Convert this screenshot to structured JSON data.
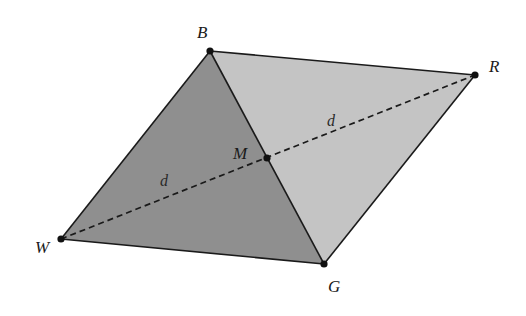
{
  "figure": {
    "type": "parallelogram-diagonal-bisection",
    "colors": {
      "background": "#ffffff",
      "left_triangle_fill": "#8f8f8f",
      "right_triangle_fill": "#c4c4c4",
      "edge": "#1a1a1a",
      "point": "#111111"
    },
    "vertices": {
      "B": {
        "label": "B",
        "x": 210,
        "y": 51,
        "label_x": 197,
        "label_y": 38
      },
      "R": {
        "label": "R",
        "x": 475,
        "y": 75,
        "label_x": 489,
        "label_y": 72
      },
      "G": {
        "label": "G",
        "x": 324,
        "y": 264,
        "label_x": 328,
        "label_y": 292
      },
      "W": {
        "label": "W",
        "x": 61,
        "y": 239,
        "label_x": 35,
        "label_y": 253
      },
      "M": {
        "label": "M",
        "x": 267,
        "y": 158,
        "label_x": 233,
        "label_y": 159
      }
    },
    "segment_labels": [
      {
        "text": "d",
        "x": 327,
        "y": 126,
        "segment": "MR"
      },
      {
        "text": "d",
        "x": 160,
        "y": 186,
        "segment": "WM"
      }
    ]
  }
}
